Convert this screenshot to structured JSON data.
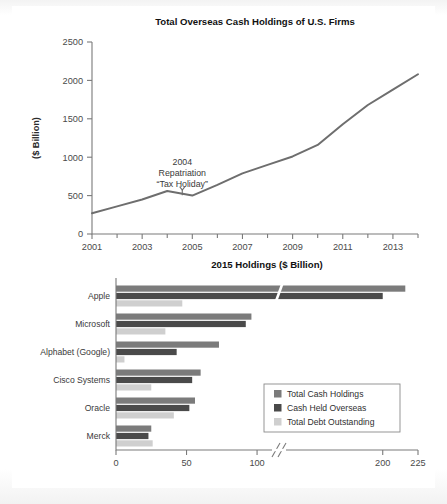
{
  "page": {
    "background": "#ffffff",
    "frame_color": "#e9e9e9"
  },
  "palette": {
    "total_cash": "#7b7b7b",
    "overseas": "#4a4a4a",
    "debt": "#cfcfcf",
    "line": "#6e6e6e",
    "axis": "#7a7a7a"
  },
  "chart_data": [
    {
      "type": "line",
      "title": "Total Overseas Cash Holdings of U.S. Firms",
      "xlabel": "",
      "ylabel": "($ Billion)",
      "ylim": [
        0,
        2500
      ],
      "yticks": [
        0,
        500,
        1000,
        1500,
        2000,
        2500
      ],
      "ytick_labels": [
        "0",
        "500",
        "1000",
        "1500",
        "2000",
        "2500"
      ],
      "xlim": [
        2001,
        2014
      ],
      "xticks": [
        2001,
        2003,
        2005,
        2007,
        2009,
        2011,
        2013
      ],
      "xtick_labels": [
        "2001",
        "2003",
        "2005",
        "2007",
        "2009",
        "2011",
        "2013"
      ],
      "xminor_ticks": [
        2002,
        2004,
        2006,
        2008,
        2010,
        2012,
        2014
      ],
      "grid": false,
      "legend": "none",
      "x": [
        2001,
        2002,
        2003,
        2004,
        2005,
        2006,
        2007,
        2008,
        2009,
        2010,
        2011,
        2012,
        2013,
        2014
      ],
      "values": [
        270,
        360,
        450,
        560,
        500,
        640,
        790,
        900,
        1010,
        1160,
        1430,
        1680,
        1880,
        2080
      ],
      "annotations": [
        {
          "lines": [
            "2004",
            "Repatriation",
            "“Tax Holiday”"
          ],
          "points_to_x": 2004.6,
          "points_to_y": 520
        }
      ]
    },
    {
      "type": "bar",
      "orientation": "horizontal",
      "title": "2015 Holdings ($ Billion)",
      "xlabel": "",
      "ylabel": "",
      "xlim": [
        0,
        225
      ],
      "xticks": [
        0,
        50,
        100,
        200,
        225
      ],
      "xtick_labels": [
        "0",
        "50",
        "100",
        "200",
        "225"
      ],
      "axis_break": {
        "from": 112,
        "to": 130,
        "label": "broken axis"
      },
      "grid": false,
      "legend_position": "lower right",
      "categories": [
        "Apple",
        "Microsoft",
        "Alphabet (Google)",
        "Cisco Systems",
        "Oracle",
        "Merck"
      ],
      "series": [
        {
          "name": "Total Cash Holdings",
          "color": "#7b7b7b",
          "values": [
            216,
            96,
            73,
            60,
            56,
            25
          ]
        },
        {
          "name": "Cash Held Overseas",
          "color": "#4a4a4a",
          "values": [
            200,
            92,
            43,
            54,
            52,
            23
          ]
        },
        {
          "name": "Total Debt Outstanding",
          "color": "#cfcfcf",
          "values": [
            47,
            35,
            6,
            25,
            41,
            26
          ]
        }
      ]
    }
  ]
}
